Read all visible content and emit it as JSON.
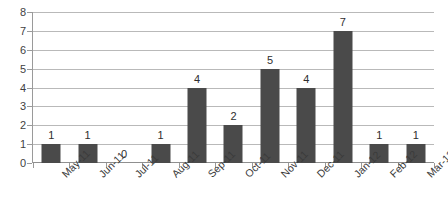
{
  "chart_data": {
    "type": "bar",
    "title": "",
    "subtitle": "",
    "xlabel": "",
    "ylabel": "",
    "categories": [
      "May-11",
      "Jun-11",
      "Jul-11",
      "Aug-11",
      "Sep-11",
      "Oct-11",
      "Nov-11",
      "Dec-11",
      "Jan-12",
      "Feb-12",
      "Mar-12"
    ],
    "values": [
      1,
      1,
      0,
      1,
      4,
      2,
      5,
      4,
      7,
      1,
      1
    ],
    "value_labels": [
      "1",
      "1",
      "0",
      "1",
      "4",
      "2",
      "5",
      "4",
      "7",
      "1",
      "1"
    ],
    "ylim": [
      0,
      8
    ],
    "y_ticks": [
      0,
      1,
      2,
      3,
      4,
      5,
      6,
      7,
      8
    ],
    "y_tick_labels": [
      "0",
      "1",
      "2",
      "3",
      "4",
      "5",
      "6",
      "7",
      "8"
    ],
    "grid": true,
    "grid_axis": "y",
    "legend": false,
    "legend_position": "none",
    "data_labels": true,
    "series": [
      {
        "name": "Count",
        "values": [
          1,
          1,
          0,
          1,
          4,
          2,
          5,
          4,
          7,
          1,
          1
        ]
      }
    ]
  },
  "style": {
    "bar_color": "#4a4a4a",
    "gridline_color": "#b9b9b9",
    "axis_color": "#9a9a9a",
    "text_color": "#3a3a3a",
    "background": "#ffffff"
  }
}
